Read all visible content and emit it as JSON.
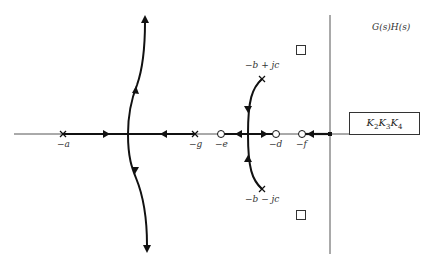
{
  "title": "G(s)H(s)",
  "gain_box": {
    "text": "K2K3K4",
    "parts": [
      {
        "base": "K",
        "sub": "2"
      },
      {
        "base": "K",
        "sub": "3"
      },
      {
        "base": "K",
        "sub": "4"
      }
    ]
  },
  "real_axis_points": [
    {
      "label": "−a",
      "type": "pole",
      "x": 63
    },
    {
      "label": "−g",
      "type": "pole",
      "x": 195
    },
    {
      "label": "−e",
      "type": "zero",
      "x": 221
    },
    {
      "label": "−d",
      "type": "zero",
      "x": 276
    },
    {
      "label": "−f",
      "type": "zero",
      "x": 302
    }
  ],
  "complex_poles": [
    {
      "label": "−b + jc",
      "type": "pole"
    },
    {
      "label": "−b − jc",
      "type": "pole"
    }
  ],
  "squares": [
    {
      "name": "upper-square"
    },
    {
      "name": "lower-square"
    }
  ],
  "colors": {
    "line": "#222222",
    "axis": "#555555",
    "background": "#ffffff"
  }
}
